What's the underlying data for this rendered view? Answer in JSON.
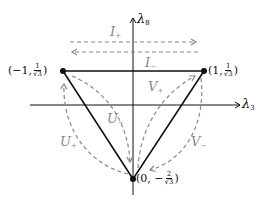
{
  "diagram": {
    "type": "weight-diagram",
    "axes": {
      "horizontal": {
        "label": "λ",
        "subscript": "3"
      },
      "vertical": {
        "label": "λ",
        "subscript": "8"
      }
    },
    "vertices": [
      {
        "id": "left",
        "text_prefix": "(−1, ",
        "frac_num": "1",
        "frac_den": "√3",
        "text_suffix": ")"
      },
      {
        "id": "right",
        "text_prefix": "(1, ",
        "frac_num": "1",
        "frac_den": "√3",
        "text_suffix": ")"
      },
      {
        "id": "bottom",
        "text_prefix": "(0, −",
        "frac_num": "2",
        "frac_den": "√3",
        "text_suffix": ")"
      }
    ],
    "operators": [
      {
        "id": "I_plus",
        "base": "I",
        "sign": "+"
      },
      {
        "id": "I_minus",
        "base": "I",
        "sign": "−"
      },
      {
        "id": "V_plus",
        "base": "V",
        "sign": "+"
      },
      {
        "id": "V_minus",
        "base": "V",
        "sign": "−"
      },
      {
        "id": "U_plus",
        "base": "U",
        "sign": "+"
      },
      {
        "id": "U_minus",
        "base": "U",
        "sign": "−"
      }
    ],
    "colors": {
      "line": "#111111",
      "dashed": "#888888"
    }
  }
}
